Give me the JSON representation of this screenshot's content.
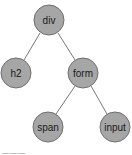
{
  "diagram": {
    "type": "tree",
    "nodes": [
      {
        "id": "div",
        "label": "div",
        "cx": 49,
        "cy": 20
      },
      {
        "id": "h2",
        "label": "h2",
        "cx": 16,
        "cy": 73
      },
      {
        "id": "form",
        "label": "form",
        "cx": 83,
        "cy": 73
      },
      {
        "id": "span",
        "label": "span",
        "cx": 48,
        "cy": 127
      },
      {
        "id": "input",
        "label": "input",
        "cx": 115,
        "cy": 127
      }
    ],
    "edges": [
      [
        "div",
        "h2"
      ],
      [
        "div",
        "form"
      ],
      [
        "form",
        "span"
      ],
      [
        "form",
        "input"
      ]
    ],
    "caption": "———"
  }
}
